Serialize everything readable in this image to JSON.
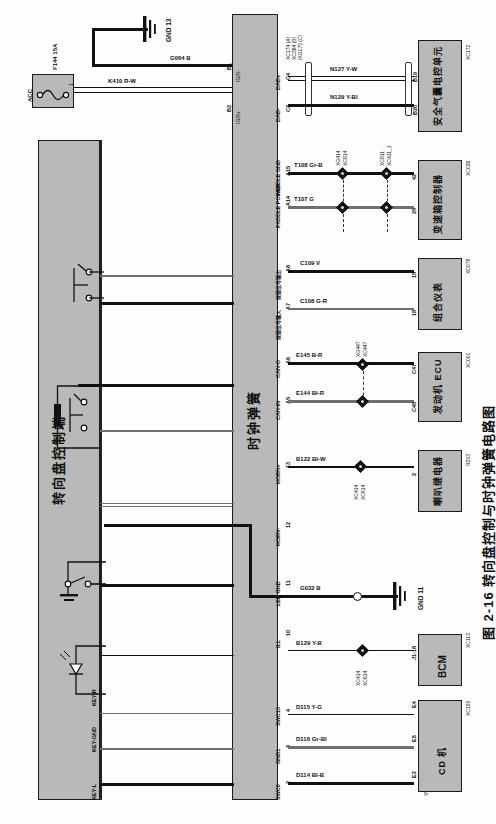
{
  "figure": {
    "caption": "图 2-16  转向盘控制与时钟弹簧电路图"
  },
  "power": {
    "source_label": "ACC",
    "fuse_label": "F144  15A",
    "fuse_pin_left": "2",
    "fuse_pin_right": "1",
    "wire_acc": "K410  R-W",
    "wire_gnd": "G064  B",
    "ground_label": "GND  13"
  },
  "left_module": {
    "name": "转向盘控制端",
    "pins": [
      {
        "label": "KEY-R"
      },
      {
        "label": "KEY-GND"
      },
      {
        "label": "KEY-L"
      }
    ],
    "symbols": [
      "switch",
      "switch",
      "resistor",
      "switch-ground",
      "led-diode"
    ]
  },
  "clock_spring": {
    "name": "时钟弹簧",
    "connector_codes": "XC174 (A)\nXC384 (B)\n/XG175 (C)",
    "connector_code_a": "XC174 (A)",
    "connector_code_b": "XC384 (B)",
    "connector_code_c": "/XG175 (C)",
    "supply_pin_top": "B1",
    "supply_pin_bottom": "B2",
    "supply_label_top": "IG/B-",
    "supply_label_bottom": "IG/B+",
    "pins": [
      {
        "no": "C4",
        "name": "DAB+"
      },
      {
        "no": "C3",
        "name": "DAB-"
      },
      {
        "no": "A15",
        "name": "PADDLE GND"
      },
      {
        "no": "A14",
        "name": "PADDLE POWER"
      },
      {
        "no": "A8",
        "name": "按键信号输出"
      },
      {
        "no": "A7",
        "name": "按键信号输入"
      },
      {
        "no": "A6",
        "name": "CAN-O"
      },
      {
        "no": "A5",
        "name": "CAN-IN"
      },
      {
        "no": "13",
        "name": "HORN+"
      },
      {
        "no": "12",
        "name": "HORN-"
      },
      {
        "no": "11",
        "name": "LED GND"
      },
      {
        "no": "10",
        "name": "ILL"
      },
      {
        "no": "4",
        "name": "SWC13"
      },
      {
        "no": "3",
        "name": "GND1"
      },
      {
        "no": "2",
        "name": "SWC0"
      }
    ]
  },
  "wires": [
    {
      "id": "w-n127",
      "label": "N127  Y-W",
      "from_pin": "C4",
      "to_pin": "B19"
    },
    {
      "id": "w-n129",
      "label": "N129  Y-BI",
      "from_pin": "C3",
      "to_pin": "B20"
    },
    {
      "id": "w-t108",
      "label": "T108  Gr-B",
      "from_pin": "A15",
      "to_pin": "42"
    },
    {
      "id": "w-t107",
      "label": "T107  G",
      "from_pin": "A14",
      "to_pin": "29"
    },
    {
      "id": "w-c109",
      "label": "C109  V",
      "from_pin": "A8",
      "to_pin": "15"
    },
    {
      "id": "w-c108",
      "label": "C108  G-R",
      "from_pin": "A7",
      "to_pin": "18"
    },
    {
      "id": "w-e145",
      "label": "E145  B-R",
      "from_pin": "A6",
      "to_pin": "C47"
    },
    {
      "id": "w-e144",
      "label": "E144  BI-R",
      "from_pin": "A5",
      "to_pin": "C45"
    },
    {
      "id": "w-b122",
      "label": "B122  BI-W",
      "from_pin": "13",
      "to_pin": "2"
    },
    {
      "id": "w-g032",
      "label": "G032  B",
      "from_pin": "11",
      "to_pin": "GND 11"
    },
    {
      "id": "w-b129",
      "label": "B129  Y-B",
      "from_pin": "10",
      "to_pin": "J1-18"
    },
    {
      "id": "w-d115",
      "label": "D115  Y-G",
      "from_pin": "4",
      "to_pin": "E4"
    },
    {
      "id": "w-d116",
      "label": "D116  Gr-BI",
      "from_pin": "3",
      "to_pin": "E5"
    },
    {
      "id": "w-d114",
      "label": "D114  BI-B",
      "from_pin": "2",
      "to_pin": "E3"
    }
  ],
  "splices": [
    {
      "top": "XG414",
      "bottom": "XC814"
    },
    {
      "top": "XC811",
      "bottom": "XC411_1"
    },
    {
      "top": "XG447",
      "bottom": "XC447"
    },
    {
      "top": "XC414",
      "bottom": "XC614"
    },
    {
      "top": "XC414",
      "bottom": "XC614"
    }
  ],
  "ground_points": [
    {
      "label": "GND  13"
    },
    {
      "label": "GND  11"
    }
  ],
  "modules": [
    {
      "id": "airbag",
      "name": "安全气囊电控单元",
      "code": "XC172",
      "pins": [
        "B19",
        "B20"
      ]
    },
    {
      "id": "trans",
      "name": "变速箱控制器",
      "code": "XC036",
      "pins": [
        "42",
        "29"
      ]
    },
    {
      "id": "cluster",
      "name": "组合仪表",
      "code": "XC078",
      "pins": [
        "15",
        "18"
      ]
    },
    {
      "id": "ecu",
      "name": "发动机 ECU",
      "code": "XC001",
      "pins": [
        "C47",
        "C45"
      ]
    },
    {
      "id": "horn",
      "name": "喇叭继电器",
      "code": "R203",
      "pins": [
        "2"
      ]
    },
    {
      "id": "bcm",
      "name": "BCM",
      "code": "XC113",
      "pins": [
        "J1-18"
      ],
      "sub": "ILL"
    },
    {
      "id": "cd",
      "name": "CD 机",
      "code": "XC155",
      "pins": [
        "E4",
        "E5",
        "E3"
      ],
      "sub": [
        "SWC1",
        "GND1",
        "SWC0"
      ]
    }
  ],
  "colors": {
    "module_fill": "#b9b9b9",
    "wire": "#111111",
    "wire_gray": "#6f6f6f",
    "page_bg": "#fefefe"
  }
}
